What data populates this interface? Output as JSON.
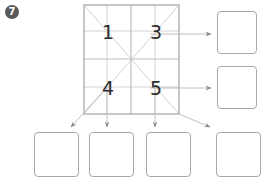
{
  "badge": {
    "label": "7",
    "color": "#5a5a5a"
  },
  "grid": {
    "cells": [
      {
        "label": "1",
        "position": "top-left"
      },
      {
        "label": "3",
        "position": "top-right"
      },
      {
        "label": "4",
        "position": "bottom-left"
      },
      {
        "label": "5",
        "position": "bottom-right"
      }
    ],
    "line_color": "#c8c8c8",
    "border_color": "#b0b0b0"
  },
  "right_boxes": [
    {
      "label": ""
    },
    {
      "label": ""
    }
  ],
  "bottom_boxes": [
    {
      "label": ""
    },
    {
      "label": ""
    },
    {
      "label": ""
    },
    {
      "label": ""
    }
  ],
  "arrow_color": "#8a8a8a",
  "box_border_color": "#a8a8a8"
}
